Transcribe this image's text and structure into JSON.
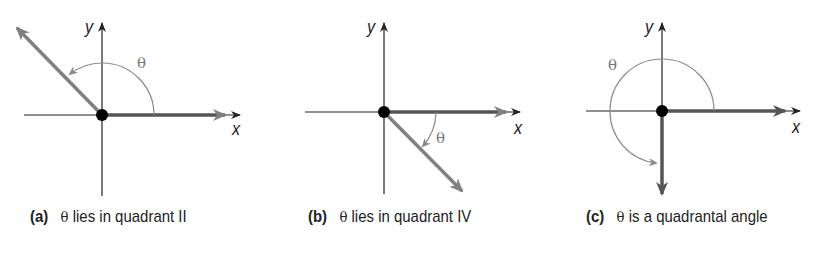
{
  "figure": {
    "panels": [
      {
        "tag": "(a)",
        "theta": "θ",
        "text": " lies in quadrant II",
        "x_label": "x",
        "y_label": "y",
        "theta_label": "θ",
        "terminal_side": "quadrant II",
        "angle_direction": "counterclockwise"
      },
      {
        "tag": "(b)",
        "theta": "θ",
        "text": " lies in quadrant IV",
        "x_label": "x",
        "y_label": "y",
        "theta_label": "θ",
        "terminal_side": "quadrant IV",
        "angle_direction": "clockwise"
      },
      {
        "tag": "(c)",
        "theta": "θ",
        "text": " is a quadrantal angle",
        "x_label": "x",
        "y_label": "y",
        "theta_label": "θ",
        "terminal_side": "negative y-axis",
        "angle_direction": "counterclockwise"
      }
    ],
    "colors": {
      "axis": "#222222",
      "ray": "#808080",
      "initial_side": "#3a3a3a",
      "arc": "#8a8a8a",
      "origin": "#000000"
    }
  }
}
